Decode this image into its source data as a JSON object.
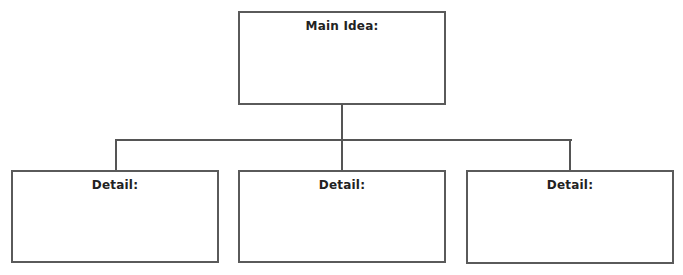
{
  "diagram": {
    "type": "tree-organizer",
    "main": {
      "label": "Main Idea:"
    },
    "details": [
      {
        "label": "Detail:"
      },
      {
        "label": "Detail:"
      },
      {
        "label": "Detail:"
      }
    ],
    "colors": {
      "border": "#5a5a5a",
      "line": "#555555",
      "text": "#222222",
      "background": "#ffffff"
    }
  }
}
